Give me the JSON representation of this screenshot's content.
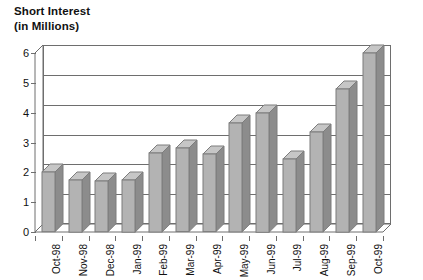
{
  "chart_data": {
    "type": "bar",
    "title": "Short Interest",
    "subtitle": "(in Millions)",
    "xlabel": "",
    "ylabel": "",
    "ylim": [
      0,
      6
    ],
    "ytick_step": 1,
    "ytick_labels": [
      "0",
      "1",
      "2",
      "3",
      "4",
      "5",
      "6"
    ],
    "grid": true,
    "legend": "none",
    "style": "3d-column",
    "bar_color": "#b3b3b3",
    "bar_side_color": "#8c8c8c",
    "bar_outline_color": "#7d7d7d",
    "axis_color": "#6e6e6e",
    "categories": [
      "Oct-98",
      "Nov-98",
      "Dec-98",
      "Jan-99",
      "Feb-99",
      "Mar-99",
      "Apr-99",
      "May-99",
      "Jun-99",
      "Jul-99",
      "Aug-99",
      "Sep-99",
      "Oct-99"
    ],
    "values": [
      2.0,
      1.75,
      1.7,
      1.75,
      2.65,
      2.8,
      2.6,
      3.65,
      4.0,
      2.45,
      3.35,
      4.8,
      6.0
    ]
  }
}
